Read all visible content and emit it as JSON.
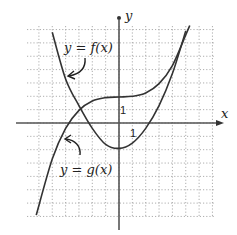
{
  "chart_data": {
    "type": "line",
    "title": "",
    "xlabel": "x",
    "ylabel": "y",
    "xlim": [
      -7,
      7
    ],
    "ylim": [
      -7,
      7.3
    ],
    "grid": true,
    "tick_labels": {
      "x": "1",
      "y": "1"
    },
    "series": [
      {
        "name": "y = f(x)",
        "kind": "parabola",
        "x": [
          -5,
          -4,
          -3,
          -2,
          -1,
          0,
          1,
          2,
          3,
          4,
          5
        ],
        "y": [
          6.8,
          3.3,
          1.3,
          -0.4,
          -1.6,
          -1.9,
          -1.5,
          -0.4,
          1.3,
          3.7,
          6.9
        ]
      },
      {
        "name": "y = g(x)",
        "kind": "cubic",
        "x": [
          -6.2,
          -5,
          -4,
          -3,
          -2,
          -1,
          0,
          1,
          2,
          3,
          4,
          5,
          5.3
        ],
        "y": [
          -6.9,
          -2.7,
          -0.4,
          0.95,
          1.65,
          1.9,
          1.95,
          2.0,
          2.25,
          2.95,
          4.3,
          6.6,
          7.3
        ]
      }
    ],
    "annotations": [
      {
        "text": "y = f(x)",
        "points_to": "left descending branch of f"
      },
      {
        "text": "y = g(x)",
        "points_to": "left rising branch of g"
      }
    ]
  }
}
